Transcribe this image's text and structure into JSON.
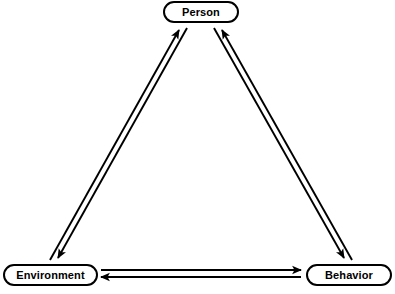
{
  "diagram": {
    "background_color": "#ffffff",
    "stroke_color": "#000000",
    "nodes": [
      {
        "id": "person",
        "label": "Person",
        "shape": "rounded-rectangle",
        "x": 163,
        "y": 1,
        "width": 76,
        "height": 22
      },
      {
        "id": "environment",
        "label": "Environment",
        "shape": "rounded-rectangle",
        "x": 3,
        "y": 264,
        "width": 95,
        "height": 22
      },
      {
        "id": "behavior",
        "label": "Behavior",
        "shape": "rounded-rectangle",
        "x": 306,
        "y": 264,
        "width": 86,
        "height": 22
      }
    ],
    "edges": [
      {
        "id": "environment-to-person",
        "from": "environment",
        "to": "person",
        "direction": "one-way",
        "style": "solid-line-with-arrowhead"
      },
      {
        "id": "person-to-environment",
        "from": "person",
        "to": "environment",
        "direction": "one-way",
        "style": "solid-line-with-arrowhead"
      },
      {
        "id": "behavior-to-person",
        "from": "behavior",
        "to": "person",
        "direction": "one-way",
        "style": "solid-line-with-arrowhead"
      },
      {
        "id": "person-to-behavior",
        "from": "person",
        "to": "behavior",
        "direction": "one-way",
        "style": "solid-line-with-arrowhead"
      },
      {
        "id": "environment-to-behavior",
        "from": "environment",
        "to": "behavior",
        "direction": "one-way",
        "style": "solid-line-with-arrowhead"
      },
      {
        "id": "behavior-to-environment",
        "from": "behavior",
        "to": "environment",
        "direction": "one-way",
        "style": "solid-line-with-arrowhead"
      }
    ]
  }
}
